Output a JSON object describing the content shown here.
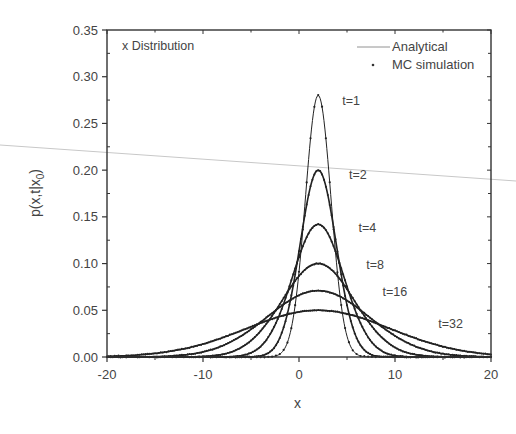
{
  "chart_data": {
    "type": "line",
    "title": "x Distribution",
    "xlabel": "x",
    "ylabel": "p(x,t|x",
    "ylabel_subscript": "0",
    "ylabel_suffix": ")",
    "xlim": [
      -20,
      20
    ],
    "ylim": [
      0,
      0.35
    ],
    "xticks": [
      -20,
      -10,
      0,
      10,
      20
    ],
    "xtick_labels": [
      "-20",
      "-10",
      "0",
      "10",
      "20"
    ],
    "yticks": [
      0.0,
      0.05,
      0.1,
      0.15,
      0.2,
      0.25,
      0.3,
      0.35
    ],
    "ytick_labels": [
      "0.00",
      "0.05",
      "0.10",
      "0.15",
      "0.20",
      "0.25",
      "0.30",
      "0.35"
    ],
    "grid": false,
    "legend": {
      "position": "upper right",
      "entries": [
        {
          "label": "Analytical",
          "marker": "line"
        },
        {
          "label": "MC simulation",
          "marker": "dot"
        }
      ]
    },
    "series": [
      {
        "name": "t=1",
        "center": 2,
        "peak": 0.28,
        "half_width": 3.2,
        "label_x": 4.5,
        "label_y": 0.27
      },
      {
        "name": "t=2",
        "center": 2,
        "peak": 0.2,
        "half_width": 4.5,
        "label_x": 5.2,
        "label_y": 0.19
      },
      {
        "name": "t=4",
        "center": 2,
        "peak": 0.142,
        "half_width": 6.4,
        "label_x": 6.2,
        "label_y": 0.134
      },
      {
        "name": "t=8",
        "center": 2,
        "peak": 0.1,
        "half_width": 9.0,
        "label_x": 7.0,
        "label_y": 0.094
      },
      {
        "name": "t=16",
        "center": 2,
        "peak": 0.071,
        "half_width": 12.7,
        "label_x": 8.7,
        "label_y": 0.065
      },
      {
        "name": "t=32",
        "center": 2,
        "peak": 0.05,
        "half_width": 18.0,
        "label_x": 14.5,
        "label_y": 0.031
      }
    ]
  }
}
